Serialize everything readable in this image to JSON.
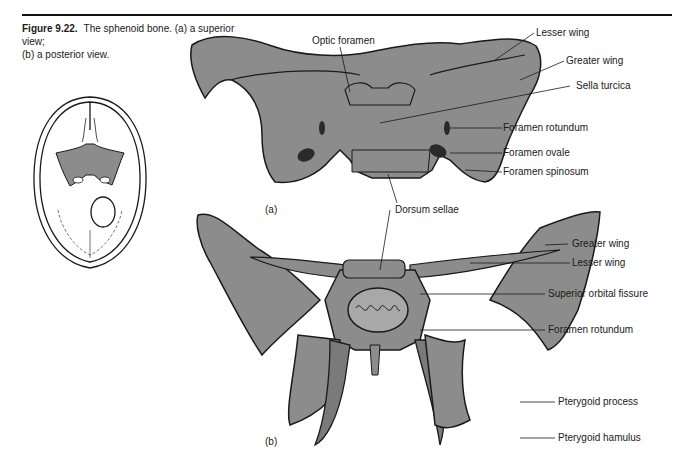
{
  "figure": {
    "number": "Figure 9.22.",
    "caption_line1": "The sphenoid bone. (a) a superior view;",
    "caption_line2": "(b) a posterior view.",
    "bone_fill": "#8c8c8c",
    "outline": "#1a1a1a"
  },
  "panel_a": {
    "part_label": "(a)",
    "title": "Superior view",
    "labels": {
      "optic_foramen": "Optic foramen",
      "lesser_wing": "Lesser wing",
      "greater_wing": "Greater wing",
      "sella_turcica": "Sella turcica",
      "foramen_rotundum": "Foramen rotundum",
      "foramen_ovale": "Foramen ovale",
      "foramen_spinosum": "Foramen spinosum",
      "dorsum_sellae": "Dorsum sellae"
    }
  },
  "panel_b": {
    "part_label": "(b)",
    "title": "Posterior view",
    "labels": {
      "greater_wing": "Greater wing",
      "lesser_wing": "Lesser wing",
      "superior_orbital_fissure": "Superior orbital fissure",
      "foramen_rotundum": "Foramen rotundum",
      "pterygoid_process": "Pterygoid process",
      "pterygoid_hamulus": "Pterygoid hamulus"
    }
  },
  "inset": {
    "title": "Skull base, superior view with sphenoid highlighted"
  }
}
